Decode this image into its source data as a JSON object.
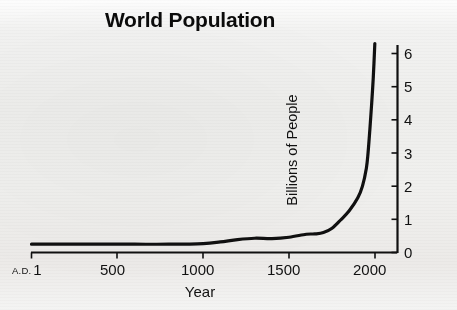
{
  "chart_data": {
    "type": "line",
    "title": "World Population",
    "xlabel": "Year",
    "ylabel": "Billions of People",
    "xlim": [
      1,
      2100
    ],
    "ylim": [
      0,
      6.6
    ],
    "grid": false,
    "legend": null,
    "x_axis": {
      "ticks": [
        1,
        500,
        1000,
        1500,
        2000
      ],
      "tick_labels": [
        "1",
        "500",
        "1000",
        "1500",
        "2000"
      ],
      "first_tick_prefix": "A.D.",
      "position": "bottom"
    },
    "y_axis": {
      "ticks": [
        0,
        1,
        2,
        3,
        4,
        5,
        6
      ],
      "tick_labels": [
        "0",
        "1",
        "2",
        "3",
        "4",
        "5",
        "6"
      ],
      "position": "right"
    },
    "series": [
      {
        "name": "World population",
        "color": "#101010",
        "line_width": 3.2,
        "x": [
          1,
          200,
          400,
          600,
          800,
          1000,
          1100,
          1200,
          1300,
          1400,
          1500,
          1600,
          1650,
          1700,
          1750,
          1800,
          1850,
          1900,
          1927,
          1950,
          1960,
          1970,
          1980,
          1990,
          1999
        ],
        "y": [
          0.25,
          0.25,
          0.25,
          0.25,
          0.25,
          0.27,
          0.32,
          0.39,
          0.43,
          0.42,
          0.46,
          0.55,
          0.56,
          0.6,
          0.73,
          0.98,
          1.26,
          1.65,
          2.0,
          2.55,
          3.03,
          3.7,
          4.44,
          5.28,
          6.3
        ]
      }
    ],
    "annotations": []
  },
  "figure": {
    "background_color": "#efefed",
    "axis_color": "#101010"
  }
}
